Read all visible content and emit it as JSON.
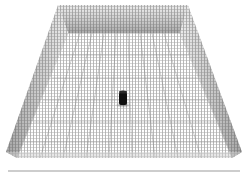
{
  "scene": {
    "description": "3D rendered rectangular arena with gridded floor and mesh walls, single dark cylinder at center",
    "background": "#ffffff",
    "grid_color": "#8a8a8a",
    "wall_shade": "#9a9a9a",
    "cylinder_color": "#111111",
    "floor_line_color": "#bdbdbd",
    "geometry": {
      "outer_top": {
        "left": [
          58,
          5
        ],
        "right": [
          188,
          5
        ]
      },
      "back_floor": {
        "left": [
          68,
          33
        ],
        "right": [
          180,
          33
        ]
      },
      "front_floor": {
        "left": [
          17,
          158
        ],
        "right": [
          232,
          158
        ]
      },
      "outer_bottom": {
        "left": [
          6,
          152
        ],
        "right": [
          242,
          152
        ]
      },
      "cylinder": {
        "x": 119,
        "y": 91,
        "w": 8,
        "h": 14
      },
      "bottom_line_y": 171
    }
  }
}
